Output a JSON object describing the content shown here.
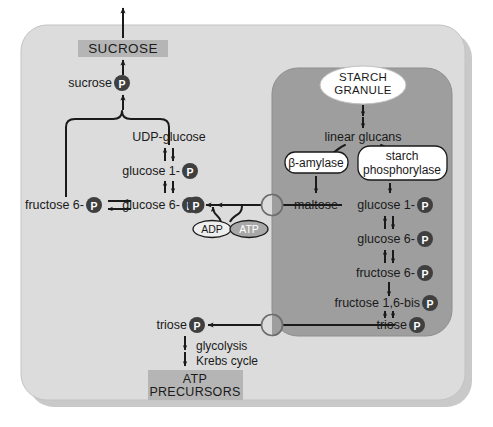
{
  "diagram": {
    "colors": {
      "page_background": "#ffffff",
      "cytosol_fill": "#dcdcdc",
      "chloroplast_fill": "#9e9e9e",
      "highlight_box_fill": "#b5b5b5",
      "phosphate_circle_fill": "#3f3f3f",
      "phosphate_letter": "#ffffff",
      "atp_ellipse_fill": "#a8a8a8",
      "adp_ellipse_fill": "#eeeeee",
      "enzyme_box_fill": "#ffffff",
      "granule_fill": "#ffffff",
      "stroke": "#1a1a1a",
      "shadow": "#c8c8c8"
    },
    "compartments": [
      {
        "name": "cytosol",
        "label": ""
      },
      {
        "name": "chloroplast",
        "label": ""
      }
    ],
    "highlight_boxes": [
      {
        "id": "sucrose-export",
        "lines": [
          "SUCROSE"
        ]
      },
      {
        "id": "atp-precursors",
        "lines": [
          "ATP",
          "PRECURSORS"
        ]
      }
    ],
    "granule": {
      "lines": [
        "STARCH",
        "GRANULE"
      ]
    },
    "enzymes": [
      {
        "id": "beta-amylase",
        "lines": [
          "β-amylase"
        ]
      },
      {
        "id": "starch-phosphorylase",
        "lines": [
          "starch",
          "phosphorylase"
        ]
      }
    ],
    "metabolites": {
      "sucrose_p": {
        "text": "sucrose",
        "phosphate": "P"
      },
      "udp_glucose": {
        "text": "UDP-glucose",
        "phosphate": ""
      },
      "glucose_1p_cyt": {
        "text": "glucose 1-",
        "phosphate": "P"
      },
      "fructose_6p_cyt": {
        "text": "fructose 6-",
        "phosphate": "P"
      },
      "glucose_6p_cyt": {
        "text": "glucose 6-",
        "phosphate": "P"
      },
      "triose_p_cyt": {
        "text": "triose",
        "phosphate": "P"
      },
      "free_p": {
        "text": "",
        "phosphate": "P"
      },
      "linear_glucans": {
        "text": "linear glucans",
        "phosphate": ""
      },
      "maltose": {
        "text": "maltose",
        "phosphate": ""
      },
      "glucose_1p_chl": {
        "text": "glucose 1-",
        "phosphate": "P"
      },
      "glucose_6p_chl": {
        "text": "glucose 6-",
        "phosphate": "P"
      },
      "fructose_6p_chl": {
        "text": "fructose 6-",
        "phosphate": "P"
      },
      "fructose_16bis_p_chl": {
        "text": "fructose 1,6-bis",
        "phosphate": "P"
      },
      "triose_p_chl": {
        "text": "triose",
        "phosphate": "P"
      }
    },
    "nucleotides": {
      "adp": "ADP",
      "atp": "ATP"
    },
    "pathway_labels": [
      {
        "id": "glycolysis",
        "text": "glycolysis"
      },
      {
        "id": "krebs-cycle",
        "text": "Krebs cycle"
      }
    ],
    "transporters": [
      {
        "id": "maltose-transporter"
      },
      {
        "id": "triose-phosphate-transporter"
      }
    ]
  }
}
